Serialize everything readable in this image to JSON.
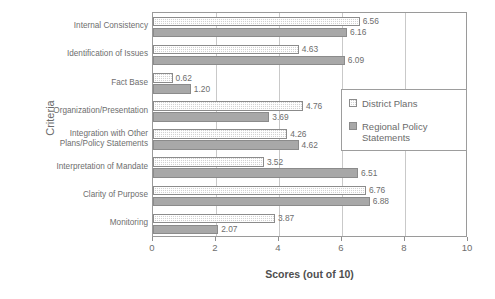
{
  "chart_data": {
    "type": "bar",
    "orientation": "horizontal",
    "title": "",
    "xlabel": "Scores (out of 10)",
    "ylabel": "Criteria",
    "xlim": [
      0,
      10
    ],
    "xticks": [
      0,
      2,
      4,
      6,
      8,
      10
    ],
    "grid": true,
    "legend_position": "right-inside",
    "categories": [
      "Internal Consistency",
      "Identification of Issues",
      "Fact Base",
      "Organization/Presentation",
      "Integration with Other Plans/Policy Statements",
      "Interpretation of Mandate",
      "Clarity of Purpose",
      "Monitoring"
    ],
    "series": [
      {
        "name": "District Plans",
        "color": "#d2d2d2",
        "pattern": "checkered",
        "values": [
          6.56,
          4.63,
          0.62,
          4.76,
          4.26,
          3.52,
          6.76,
          3.87
        ],
        "labels": [
          "6.56",
          "4.63",
          "0.62",
          "4.76",
          "4.26",
          "3.52",
          "6.76",
          "3.87"
        ]
      },
      {
        "name": "Regional Policy Statements",
        "color": "#a8a8a8",
        "pattern": "solid",
        "values": [
          6.16,
          6.09,
          1.2,
          3.69,
          4.62,
          6.51,
          6.88,
          2.07
        ],
        "labels": [
          "6.16",
          "6.09",
          "1.20",
          "3.69",
          "4.62",
          "6.51",
          "6.88",
          "2.07"
        ]
      }
    ]
  },
  "legend": {
    "items": [
      {
        "label": "District Plans"
      },
      {
        "label": "Regional Policy Statements"
      }
    ]
  }
}
